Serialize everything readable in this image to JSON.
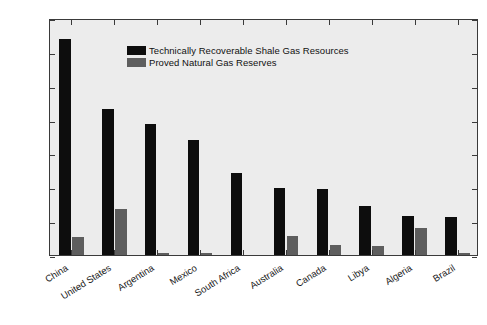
{
  "chart_data": {
    "type": "bar",
    "title": "",
    "subtitle": "",
    "xlabel": "",
    "ylabel": "Trillion Cubic Feet",
    "ylim": [
      0,
      1400
    ],
    "yticks": [
      0,
      200,
      400,
      600,
      800,
      1000,
      1200,
      1400
    ],
    "ytick_labels": [
      "0",
      "200",
      "400",
      "600",
      "800",
      "1,000",
      "1,200",
      "1,400"
    ],
    "grid": false,
    "legend_position": "upper-left-inside",
    "categories": [
      "China",
      "United States",
      "Argentina",
      "Mexico",
      "South Africa",
      "Australia",
      "Canada",
      "Libya",
      "Algeria",
      "Brazil"
    ],
    "series": [
      {
        "name": "Technically Recoverable Shale Gas Resources",
        "color": "#0d0d0d",
        "values": [
          1275,
          862,
          774,
          681,
          485,
          396,
          388,
          290,
          231,
          226
        ]
      },
      {
        "name": "Proved Natural Gas Reserves",
        "color": "#5e5e5e",
        "values": [
          107,
          272,
          13,
          12,
          0,
          110,
          62,
          54,
          159,
          13
        ]
      }
    ],
    "units": "Trillion Cubic Feet",
    "plot_background_color": "#ececec",
    "frame_color": "#3a3a3a"
  }
}
